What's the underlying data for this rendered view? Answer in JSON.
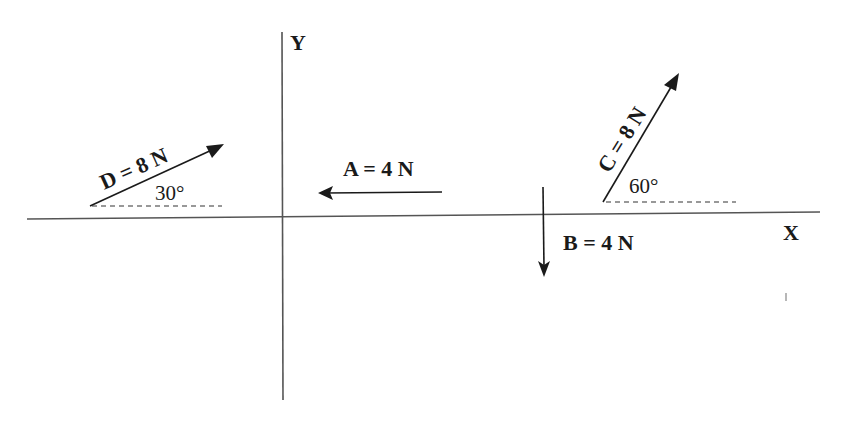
{
  "axes": {
    "x_label": "X",
    "y_label": "Y"
  },
  "vectors": [
    {
      "id": "D",
      "label": "D = 8 N",
      "magnitude": "8 N",
      "angle_label": "30°",
      "direction": "30° above +X"
    },
    {
      "id": "A",
      "label": "A = 4 N",
      "magnitude": "4 N",
      "direction": "-X"
    },
    {
      "id": "B",
      "label": "B = 4 N",
      "magnitude": "4 N",
      "direction": "-Y"
    },
    {
      "id": "C",
      "label": "C = 8 N",
      "magnitude": "8 N",
      "angle_label": "60°",
      "direction": "60° above +X"
    }
  ],
  "colors": {
    "ink": "#1a1a1a",
    "axis": "#555555",
    "background": "#ffffff"
  }
}
